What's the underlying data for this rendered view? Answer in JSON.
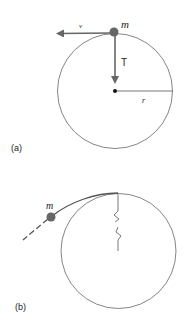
{
  "panel_a": {
    "label": "(a)",
    "mass_label": "m",
    "velocity_label": "v",
    "tension_label": "T",
    "radius_label": "r"
  },
  "panel_b": {
    "label": "(b)",
    "mass_label": "m"
  },
  "caption_fragment": "",
  "colors": {
    "line": "#555555",
    "mass": "#666666",
    "arrow": "#666666",
    "circle": "#777777"
  }
}
